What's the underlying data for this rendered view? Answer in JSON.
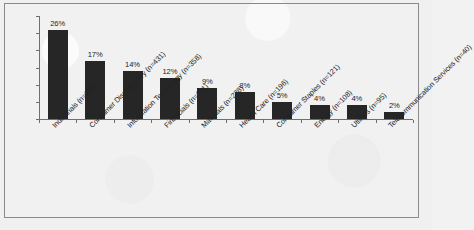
{
  "chart_data": {
    "type": "bar",
    "title": "",
    "xlabel": "",
    "ylabel": "",
    "ylim": [
      0,
      30
    ],
    "grid": false,
    "legend": "none",
    "ytick_labels": [
      "30%",
      "25%",
      "20%",
      "15%",
      "10%",
      "5%",
      "0%"
    ],
    "ytick_values": [
      30,
      25,
      20,
      15,
      10,
      5,
      0
    ],
    "categories": [
      "Industrials (n=668)",
      "Consumer Discretionary (n=431)",
      "Information Technology (n=358)",
      "Financials (n=311)",
      "Materials (n=238)",
      "Health Care (n=196)",
      "Consumer Staples (n=121)",
      "Energy (n=108)",
      "Utilities (n=95)",
      "Telecommunication Services (n=40)"
    ],
    "values": [
      26,
      17,
      14,
      12,
      9,
      8,
      5,
      4,
      4,
      2
    ],
    "data_labels": [
      "26%",
      "17%",
      "14%",
      "12%",
      "9%",
      "8%",
      "5%",
      "4%",
      "4%",
      "2%"
    ],
    "bar_color": "#262626",
    "axis_color": "#6f6f6f",
    "background_color": "#f0f0f0"
  }
}
